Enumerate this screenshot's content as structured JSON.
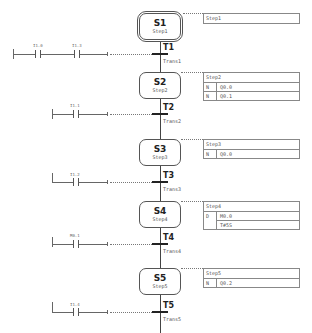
{
  "steps": [
    {
      "id": "S1",
      "name": "Step1",
      "initial": true,
      "action_header": "Step1",
      "actions": []
    },
    {
      "id": "S2",
      "name": "Step2",
      "initial": false,
      "action_header": "Step2",
      "actions": [
        {
          "qualifier": "N",
          "operand": "Q0.0"
        },
        {
          "qualifier": "N",
          "operand": "Q0.1"
        }
      ]
    },
    {
      "id": "S3",
      "name": "Step3",
      "initial": false,
      "action_header": "Step3",
      "actions": [
        {
          "qualifier": "N",
          "operand": "Q0.0"
        }
      ]
    },
    {
      "id": "S4",
      "name": "Step4",
      "initial": false,
      "action_header": "Step4",
      "actions": [
        {
          "qualifier": "D",
          "operand": "M0.0"
        },
        {
          "qualifier": "",
          "operand": "T#5S"
        }
      ]
    },
    {
      "id": "S5",
      "name": "Step5",
      "initial": false,
      "action_header": "Step5",
      "actions": [
        {
          "qualifier": "N",
          "operand": "Q0.2"
        }
      ]
    }
  ],
  "transitions": [
    {
      "id": "T1",
      "name": "Trans1",
      "contacts": [
        "I1.0",
        "I1.3"
      ]
    },
    {
      "id": "T2",
      "name": "Trans2",
      "contacts": [
        "I1.1"
      ]
    },
    {
      "id": "T3",
      "name": "Trans3",
      "contacts": [
        "I1.2"
      ]
    },
    {
      "id": "T4",
      "name": "Trans4",
      "contacts": [
        "M0.1"
      ]
    },
    {
      "id": "T5",
      "name": "Trans5",
      "contacts": [
        "I1.4"
      ]
    }
  ]
}
